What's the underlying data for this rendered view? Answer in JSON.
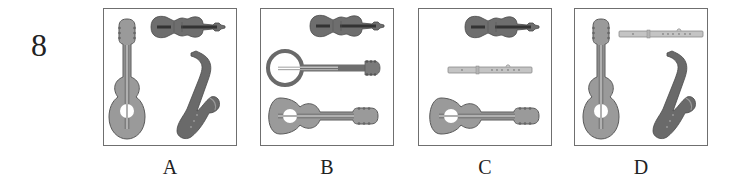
{
  "question": {
    "number": "8"
  },
  "options": [
    {
      "letter": "A",
      "instruments": [
        "guitar-vertical",
        "violin",
        "saxophone"
      ]
    },
    {
      "letter": "B",
      "instruments": [
        "violin",
        "banjo-horizontal",
        "guitar-horizontal"
      ]
    },
    {
      "letter": "C",
      "instruments": [
        "violin",
        "flute",
        "guitar-horizontal"
      ]
    },
    {
      "letter": "D",
      "instruments": [
        "guitar-vertical",
        "flute",
        "saxophone"
      ]
    }
  ],
  "colors": {
    "border": "#6f6f6f",
    "guitar_body": "#9a9a9a",
    "violin_body": "#6e6e6e",
    "saxophone": "#6a6a6a",
    "flute": "#c4c4c4",
    "text": "#222222"
  }
}
